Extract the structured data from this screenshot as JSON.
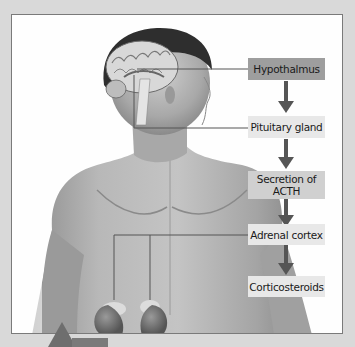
{
  "diagram": {
    "steps": [
      {
        "label": "Hypothalmus"
      },
      {
        "label": "Pituitary gland"
      },
      {
        "label": "Secretion of\nACTH"
      },
      {
        "label": "Adrenal cortex"
      },
      {
        "label": "Corticosteroids"
      }
    ],
    "colors": {
      "frame": "#7a7a7a",
      "highlight_box": "#9e9e9e",
      "light_box": "#e8e8e8",
      "arrow": "#555555",
      "leader_line": "#555555",
      "page_background": "#d9d9d9"
    },
    "illustration": "Human male torso with sagittal brain section and kidneys with adrenal glands"
  }
}
